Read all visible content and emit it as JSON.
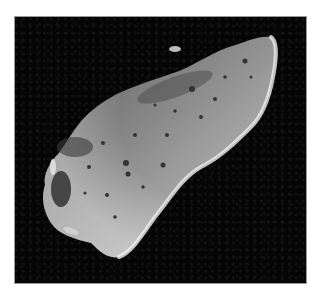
{
  "image": {
    "subject": "asteroid",
    "description": "Grayscale photograph of an elongated cratered asteroid against black space",
    "colors": {
      "background": "#050505",
      "border": "#9a9a9a",
      "surface_mid": "#8a8a8a",
      "surface_light": "#d8d8d8",
      "surface_dark": "#3a3a3a"
    }
  }
}
